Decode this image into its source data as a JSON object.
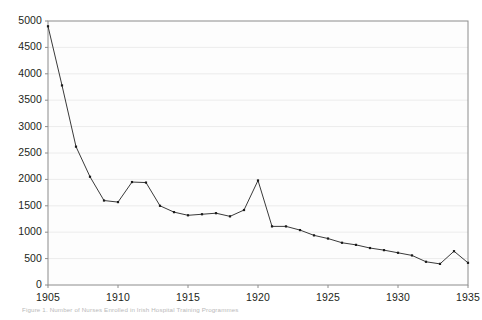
{
  "chart_data": {
    "type": "line",
    "title": "",
    "xlabel": "",
    "ylabel": "",
    "xlim": [
      1905,
      1935
    ],
    "ylim": [
      0,
      5000
    ],
    "xticks": [
      1905,
      1910,
      1915,
      1920,
      1925,
      1930,
      1935
    ],
    "yticks": [
      0,
      500,
      1000,
      1500,
      2000,
      2500,
      3000,
      3500,
      4000,
      4500,
      5000
    ],
    "grid": true,
    "grid_axis": "y",
    "legend": false,
    "markers": true,
    "line_color": "#3a3a3a",
    "marker_color": "#1a1a1a",
    "plot_background": "#fdfdfd",
    "axis_color": "#8c8c8c",
    "grid_color": "#ececec",
    "x": [
      1905,
      1906,
      1907,
      1908,
      1909,
      1910,
      1911,
      1912,
      1913,
      1914,
      1915,
      1916,
      1917,
      1918,
      1919,
      1920,
      1921,
      1922,
      1923,
      1924,
      1925,
      1926,
      1927,
      1928,
      1929,
      1930,
      1931,
      1932,
      1933,
      1934,
      1935
    ],
    "values": [
      4900,
      3780,
      2620,
      2050,
      1600,
      1570,
      1950,
      1940,
      1500,
      1380,
      1320,
      1340,
      1360,
      1300,
      1420,
      1980,
      1110,
      1110,
      1040,
      940,
      880,
      800,
      760,
      700,
      660,
      610,
      560,
      440,
      400,
      640,
      420
    ],
    "series": [
      {
        "name": "Number of Nurses Enrolled",
        "values": [
          4900,
          3780,
          2620,
          2050,
          1600,
          1570,
          1950,
          1940,
          1500,
          1380,
          1320,
          1340,
          1360,
          1300,
          1420,
          1980,
          1110,
          1110,
          1040,
          940,
          880,
          800,
          760,
          700,
          660,
          610,
          560,
          440,
          400,
          640,
          420
        ]
      }
    ]
  },
  "caption": {
    "text": "Figure 1.  Number of Nurses Enrolled in Irish Hospital Training Programmes"
  }
}
